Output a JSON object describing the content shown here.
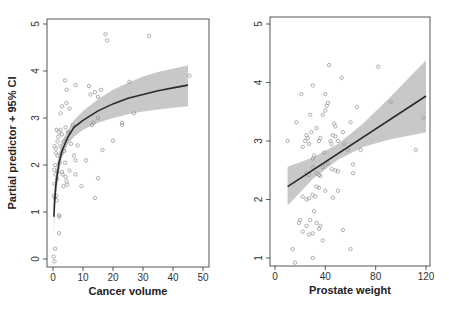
{
  "chart_data": [
    {
      "type": "scatter",
      "title": "",
      "xlabel": "Cancer volume",
      "ylabel": "Partial predictor + 95% CI",
      "xlim": [
        0,
        50
      ],
      "ylim": [
        0,
        5
      ],
      "xticks": [
        0,
        10,
        20,
        30,
        40,
        50
      ],
      "yticks": [
        0,
        1,
        2,
        3,
        4,
        5
      ],
      "grid": false,
      "legend": null,
      "fit": {
        "type": "line",
        "description": "log-shaped fitted curve",
        "x": [
          0.3,
          0.5,
          1,
          2,
          3,
          5,
          7,
          10,
          15,
          20,
          25,
          30,
          35,
          40,
          45
        ],
        "y": [
          0.9,
          1.2,
          1.6,
          2.05,
          2.3,
          2.6,
          2.8,
          2.95,
          3.15,
          3.3,
          3.42,
          3.5,
          3.58,
          3.64,
          3.7
        ]
      },
      "ci_band": {
        "x": [
          0.3,
          0.5,
          1,
          2,
          3,
          5,
          7,
          10,
          15,
          20,
          25,
          30,
          35,
          40,
          45
        ],
        "lower": [
          0.5,
          0.85,
          1.35,
          1.85,
          2.15,
          2.45,
          2.6,
          2.75,
          2.9,
          3.0,
          3.08,
          3.14,
          3.18,
          3.22,
          3.25
        ],
        "upper": [
          1.3,
          1.55,
          1.85,
          2.25,
          2.5,
          2.75,
          2.95,
          3.15,
          3.4,
          3.6,
          3.75,
          3.88,
          3.98,
          4.05,
          4.12
        ]
      },
      "points": [
        [
          0.2,
          0.05
        ],
        [
          0.5,
          -0.05
        ],
        [
          0.7,
          0.22
        ],
        [
          2.0,
          0.55
        ],
        [
          2.0,
          0.93
        ],
        [
          2.1,
          0.9
        ],
        [
          0.3,
          1.35
        ],
        [
          0.6,
          1.3
        ],
        [
          1.0,
          1.35
        ],
        [
          1.2,
          1.25
        ],
        [
          0.5,
          1.6
        ],
        [
          0.8,
          1.8
        ],
        [
          0.4,
          1.9
        ],
        [
          1.3,
          1.7
        ],
        [
          1.5,
          1.85
        ],
        [
          0.7,
          2.0
        ],
        [
          1.0,
          2.25
        ],
        [
          0.5,
          2.4
        ],
        [
          1.0,
          2.35
        ],
        [
          1.5,
          2.2
        ],
        [
          2.2,
          2.05
        ],
        [
          3.0,
          1.85
        ],
        [
          3.2,
          1.8
        ],
        [
          3.5,
          1.55
        ],
        [
          4.2,
          1.75
        ],
        [
          4.5,
          1.65
        ],
        [
          4.8,
          1.58
        ],
        [
          5.5,
          1.88
        ],
        [
          4.0,
          2.05
        ],
        [
          3.8,
          2.3
        ],
        [
          2.5,
          2.4
        ],
        [
          2.8,
          2.25
        ],
        [
          1.5,
          2.5
        ],
        [
          1.8,
          2.6
        ],
        [
          1.2,
          2.75
        ],
        [
          2.0,
          2.7
        ],
        [
          2.5,
          2.75
        ],
        [
          3.0,
          2.65
        ],
        [
          3.5,
          2.5
        ],
        [
          4.2,
          2.8
        ],
        [
          4.5,
          2.55
        ],
        [
          5.0,
          2.7
        ],
        [
          5.5,
          2.7
        ],
        [
          6.0,
          2.45
        ],
        [
          6.5,
          2.85
        ],
        [
          7.0,
          2.2
        ],
        [
          7.5,
          2.1
        ],
        [
          7.5,
          1.8
        ],
        [
          8.2,
          2.42
        ],
        [
          9.5,
          1.55
        ],
        [
          11.0,
          2.1
        ],
        [
          14.0,
          1.3
        ],
        [
          15.0,
          1.72
        ],
        [
          16.5,
          2.32
        ],
        [
          2.5,
          3.1
        ],
        [
          3.0,
          3.25
        ],
        [
          4.5,
          3.32
        ],
        [
          5.5,
          3.2
        ],
        [
          4.0,
          3.8
        ],
        [
          4.5,
          3.6
        ],
        [
          7.5,
          3.7
        ],
        [
          12.0,
          3.68
        ],
        [
          12.5,
          3.5
        ],
        [
          14.0,
          3.55
        ],
        [
          15.0,
          3.45
        ],
        [
          16.0,
          3.6
        ],
        [
          13.0,
          2.85
        ],
        [
          13.5,
          2.9
        ],
        [
          15.0,
          3.0
        ],
        [
          20.0,
          2.52
        ],
        [
          23.0,
          2.85
        ],
        [
          23.0,
          2.9
        ],
        [
          25.5,
          3.77
        ],
        [
          27.0,
          3.1
        ],
        [
          45.5,
          3.9
        ],
        [
          17.5,
          4.78
        ],
        [
          18.0,
          4.65
        ],
        [
          32.0,
          4.75
        ]
      ]
    },
    {
      "type": "scatter",
      "title": "",
      "xlabel": "Prostate weight",
      "ylabel": "",
      "xlim": [
        0,
        120
      ],
      "ylim": [
        1,
        5
      ],
      "xticks": [
        0,
        40,
        80,
        120
      ],
      "yticks": [
        1,
        2,
        3,
        4,
        5
      ],
      "grid": false,
      "legend": null,
      "fit": {
        "type": "line",
        "x": [
          10,
          120
        ],
        "y": [
          2.22,
          3.77
        ]
      },
      "ci_band": {
        "x": [
          10,
          30,
          50,
          70,
          90,
          120
        ],
        "lower": [
          1.9,
          2.35,
          2.68,
          2.9,
          3.02,
          3.15
        ],
        "upper": [
          2.56,
          2.72,
          2.95,
          3.3,
          3.72,
          4.38
        ]
      },
      "points": [
        [
          10,
          3.0
        ],
        [
          17,
          3.32
        ],
        [
          21,
          3.8
        ],
        [
          22,
          2.9
        ],
        [
          24,
          3.0
        ],
        [
          25,
          3.1
        ],
        [
          26,
          3.05
        ],
        [
          27,
          2.95
        ],
        [
          28,
          3.45
        ],
        [
          29,
          3.15
        ],
        [
          30,
          3.95
        ],
        [
          30,
          2.7
        ],
        [
          31,
          2.75
        ],
        [
          33,
          3.22
        ],
        [
          35,
          3.0
        ],
        [
          36,
          3.05
        ],
        [
          38,
          3.45
        ],
        [
          39,
          2.8
        ],
        [
          40,
          3.52
        ],
        [
          40,
          3.8
        ],
        [
          41,
          3.6
        ],
        [
          42,
          3.65
        ],
        [
          43,
          4.3
        ],
        [
          44,
          3.0
        ],
        [
          45,
          2.95
        ],
        [
          46,
          3.1
        ],
        [
          47,
          3.3
        ],
        [
          48,
          3.25
        ],
        [
          48,
          3.08
        ],
        [
          50,
          3.0
        ],
        [
          53,
          4.08
        ],
        [
          54,
          3.15
        ],
        [
          55,
          2.95
        ],
        [
          58,
          2.85
        ],
        [
          60,
          3.32
        ],
        [
          62,
          2.6
        ],
        [
          62,
          2.45
        ],
        [
          65,
          3.58
        ],
        [
          68,
          2.85
        ],
        [
          82,
          4.27
        ],
        [
          92,
          3.67
        ],
        [
          112,
          2.85
        ],
        [
          118,
          3.4
        ],
        [
          25,
          2.45
        ],
        [
          27,
          2.42
        ],
        [
          30,
          2.55
        ],
        [
          33,
          2.45
        ],
        [
          35,
          2.42
        ],
        [
          36,
          2.4
        ],
        [
          38,
          2.55
        ],
        [
          40,
          2.6
        ],
        [
          42,
          2.62
        ],
        [
          45,
          2.52
        ],
        [
          48,
          2.5
        ],
        [
          50,
          2.48
        ],
        [
          22,
          2.05
        ],
        [
          25,
          2.0
        ],
        [
          27,
          2.02
        ],
        [
          30,
          2.08
        ],
        [
          32,
          2.05
        ],
        [
          33,
          2.22
        ],
        [
          35,
          2.2
        ],
        [
          40,
          2.15
        ],
        [
          46,
          2.03
        ],
        [
          50,
          2.15
        ],
        [
          19,
          1.6
        ],
        [
          20,
          1.65
        ],
        [
          22,
          1.45
        ],
        [
          25,
          1.55
        ],
        [
          27,
          1.4
        ],
        [
          28,
          1.65
        ],
        [
          30,
          1.42
        ],
        [
          31,
          1.8
        ],
        [
          33,
          1.6
        ],
        [
          35,
          1.5
        ],
        [
          36,
          1.55
        ],
        [
          38,
          1.3
        ],
        [
          54,
          1.48
        ],
        [
          14,
          1.15
        ],
        [
          16,
          0.92
        ],
        [
          30,
          1.0
        ],
        [
          60,
          1.15
        ]
      ]
    }
  ],
  "panels": [
    {
      "xlabel": "Cancer volume",
      "ylabel": "Partial predictor + 95% CI",
      "xtick_labels": [
        "0",
        "10",
        "20",
        "30",
        "40",
        "50"
      ],
      "ytick_labels": [
        "0",
        "1",
        "2",
        "3",
        "4",
        "5"
      ]
    },
    {
      "xlabel": "Prostate weight",
      "ylabel": "",
      "xtick_labels": [
        "0",
        "40",
        "80",
        "120"
      ],
      "ytick_labels": [
        "1",
        "2",
        "3",
        "4",
        "5"
      ]
    }
  ],
  "colors": {
    "band": "#c8c8c8",
    "line": "#2a2a2a",
    "points": "#9a9a9a",
    "axis": "#333333"
  }
}
